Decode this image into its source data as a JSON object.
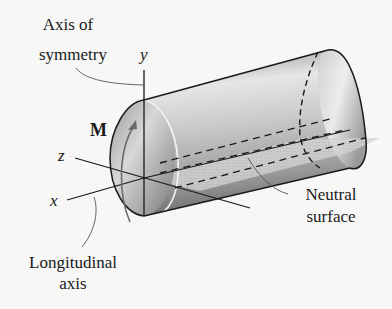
{
  "diagram": {
    "type": "beam-bending-3d",
    "labels": {
      "axis_of_symmetry_line1": "Axis of",
      "axis_of_symmetry_line2": "symmetry",
      "y_axis": "y",
      "z_axis": "z",
      "x_axis": "x",
      "moment": "M",
      "neutral_surface_line1": "Neutral",
      "neutral_surface_line2": "surface",
      "longitudinal_axis_line1": "Longitudinal",
      "longitudinal_axis_line2": "axis"
    },
    "colors": {
      "background": "#f7f7f6",
      "cylinder_light": "#e8e8e8",
      "cylinder_dark": "#8a8a8a",
      "neutral_plane": "#d4d4d4",
      "stroke": "#1a1a1a"
    }
  }
}
